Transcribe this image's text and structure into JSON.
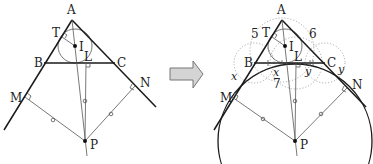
{
  "left_diagram": {
    "points": {
      "A": {
        "label": "A",
        "x": 72,
        "y": 20
      },
      "B": {
        "label": "B",
        "x": 44,
        "y": 63
      },
      "C": {
        "label": "C",
        "x": 115,
        "y": 63
      },
      "T": {
        "label": "T",
        "x": 62,
        "y": 36
      },
      "I": {
        "label": "I",
        "x": 75,
        "y": 46
      },
      "L": {
        "label": "L",
        "x": 86,
        "y": 63
      },
      "M": {
        "label": "M",
        "x": 25,
        "y": 97
      },
      "N": {
        "label": "N",
        "x": 135,
        "y": 86
      },
      "P": {
        "label": "P",
        "x": 85,
        "y": 141
      }
    }
  },
  "arrow": {
    "fill": "#d4d4d4",
    "stroke": "#777777"
  },
  "right_diagram": {
    "points": {
      "A": {
        "label": "A",
        "x": 282,
        "y": 20
      },
      "B": {
        "label": "B",
        "x": 254,
        "y": 63
      },
      "C": {
        "label": "C",
        "x": 325,
        "y": 63
      },
      "T": {
        "label": "T",
        "x": 272,
        "y": 36
      },
      "I": {
        "label": "I",
        "x": 285,
        "y": 46
      },
      "L": {
        "label": "L",
        "x": 296,
        "y": 63
      },
      "M": {
        "label": "M",
        "x": 232,
        "y": 97
      },
      "N": {
        "label": "N",
        "x": 347,
        "y": 88
      },
      "P": {
        "label": "P",
        "x": 295,
        "y": 141
      }
    },
    "segment_labels": {
      "AB": "5",
      "AC": "6",
      "BM": "x",
      "CN": "y",
      "BL_x": "x",
      "BC_7": "7",
      "LC_y": "y"
    }
  }
}
